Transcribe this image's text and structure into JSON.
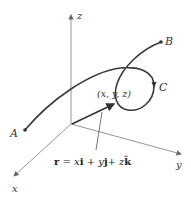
{
  "diagram": {
    "axes": {
      "z_label": "z",
      "y_label": "y",
      "x_label": "x"
    },
    "points": {
      "A": "A",
      "B": "B",
      "C": "C",
      "position": "(x, y, z)"
    },
    "equation": {
      "r": "r",
      "eq": " = ",
      "x": "x",
      "i": "i",
      "plus1": " + ",
      "y": "y",
      "j": "j",
      "plus2": "+ ",
      "z": "z",
      "k": "k̂"
    },
    "colors": {
      "axis": "#8a8a8a",
      "curve": "#3a3a3a",
      "text": "#333333"
    }
  }
}
